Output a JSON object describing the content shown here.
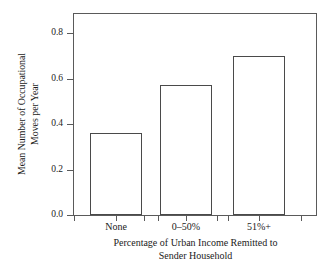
{
  "chart_data": {
    "type": "bar",
    "title": "",
    "subtitle": "",
    "categories": [
      "None",
      "0–50%",
      "51%+"
    ],
    "values": [
      0.36,
      0.57,
      0.7
    ],
    "series": [
      {
        "name": "Mean Number of Occupational Moves per Year",
        "values": [
          0.36,
          0.57,
          0.7
        ]
      }
    ],
    "xlabel_line1": "Percentage of Urban Income Remitted to",
    "xlabel_line2": "Sender Household",
    "ylabel_line1": "Mean Number of Occupational",
    "ylabel_line2": "Moves per Year",
    "ylim": [
      0.0,
      0.88
    ],
    "ytick_values": [
      0.0,
      0.2,
      0.4,
      0.6,
      0.8
    ],
    "ytick_labels": [
      "0.0",
      "0.2",
      "0.4",
      "0.6",
      "0.8"
    ],
    "grid": false,
    "legend": false,
    "legend_position": "none",
    "bar_fill_color": "#ffffff",
    "bar_edge_color": "#4a4a4a",
    "axis_color": "#5a5a5a",
    "background_color": "#ffffff",
    "text_color": "#1b1b1b"
  }
}
